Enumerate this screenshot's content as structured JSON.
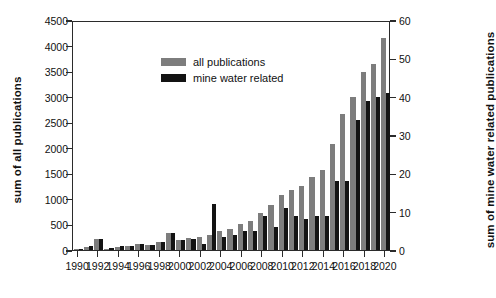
{
  "chart_data": {
    "type": "bar",
    "title": "",
    "subtitle": "",
    "xlabel": "",
    "ylabel": "sum of all publications",
    "y2label": "sum of mine water related publications",
    "grid": false,
    "legend_position": "top-left",
    "ylim": [
      0,
      4500
    ],
    "y2lim": [
      0,
      60
    ],
    "ytick_step": 500,
    "y2tick_step": 10,
    "yticks": [
      "0",
      "500",
      "1000",
      "1500",
      "2000",
      "2500",
      "3000",
      "3500",
      "4000",
      "4500"
    ],
    "y2ticks": [
      "0",
      "10",
      "20",
      "30",
      "40",
      "50",
      "60"
    ],
    "xtick_labels": [
      "1990",
      "1992",
      "1994",
      "1996",
      "1998",
      "2000",
      "2002",
      "2004",
      "2006",
      "2008",
      "2010",
      "2012",
      "2014",
      "2016",
      "2018",
      "2020"
    ],
    "categories": [
      "1990",
      "1991",
      "1992",
      "1993",
      "1994",
      "1995",
      "1996",
      "1997",
      "1998",
      "1999",
      "2000",
      "2001",
      "2002",
      "2003",
      "2004",
      "2005",
      "2006",
      "2007",
      "2008",
      "2009",
      "2010",
      "2011",
      "2012",
      "2013",
      "2014",
      "2015",
      "2016",
      "2017",
      "2018",
      "2019",
      "2020"
    ],
    "series": [
      {
        "name": "all publications",
        "color": "#7d7d7d",
        "axis": "left",
        "values": [
          10,
          60,
          210,
          20,
          60,
          75,
          120,
          100,
          160,
          340,
          200,
          230,
          250,
          300,
          380,
          420,
          500,
          570,
          720,
          880,
          1070,
          1180,
          1260,
          1430,
          1570,
          2070,
          2670,
          2990,
          3480,
          3640,
          4140
        ]
      },
      {
        "name": "mine water related",
        "color": "#131313",
        "axis": "right",
        "values": [
          0,
          1,
          3,
          0.4,
          1,
          1,
          1.5,
          1.3,
          2,
          4.5,
          2.5,
          3,
          1.5,
          12,
          3.5,
          4,
          5,
          5,
          9,
          6,
          11,
          9,
          8,
          9,
          9,
          18,
          18,
          34,
          39,
          40,
          41
        ]
      }
    ],
    "legend": [
      {
        "label": "all publications",
        "color": "#7d7d7d"
      },
      {
        "label": "mine water related",
        "color": "#131313"
      }
    ]
  }
}
